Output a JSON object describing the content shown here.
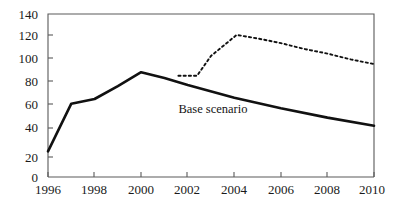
{
  "chart_data": {
    "type": "line",
    "title": "",
    "xlabel": "",
    "ylabel": "",
    "xlim": [
      1996,
      2010
    ],
    "ylim": [
      0,
      140
    ],
    "grid": false,
    "legend_position": "inline-annotation",
    "x_ticks": [
      "1996",
      "1998",
      "2000",
      "2002",
      "2004",
      "2006",
      "2008",
      "2010"
    ],
    "x_tick_values": [
      1996,
      1998,
      2000,
      2002,
      2004,
      2006,
      2008,
      2010
    ],
    "y_ticks": [
      "0",
      "20",
      "40",
      "60",
      "80",
      "100",
      "120",
      "140"
    ],
    "y_tick_values": [
      0,
      20,
      40,
      60,
      80,
      100,
      120,
      140
    ],
    "annotations": [
      {
        "text": "Base scenario",
        "x": 2001.6,
        "y": 55,
        "name": "base-scenario-label"
      }
    ],
    "series": [
      {
        "name": "Base scenario",
        "style": "solid",
        "color": "#111111",
        "x": [
          1996,
          1997,
          1998,
          1999,
          2000,
          2001,
          2002,
          2004,
          2006,
          2008,
          2010
        ],
        "values": [
          22,
          63,
          67,
          78,
          90,
          85,
          79,
          68,
          59,
          51,
          44
        ]
      },
      {
        "name": "Alternative scenario",
        "style": "dotted",
        "color": "#111111",
        "x": [
          2001.6,
          2002.4,
          2003.0,
          2004.1,
          2005.0,
          2006.0,
          2007.0,
          2008.0,
          2009.0,
          2010.0
        ],
        "values": [
          87,
          87,
          104,
          122,
          119,
          115,
          110,
          106,
          101,
          97
        ]
      }
    ]
  },
  "axes": {
    "frame_color": "#5a5a5a",
    "tick_color": "#5a5a5a",
    "text_color": "#1a1a1a"
  },
  "clipped_header": {
    "text": ""
  }
}
